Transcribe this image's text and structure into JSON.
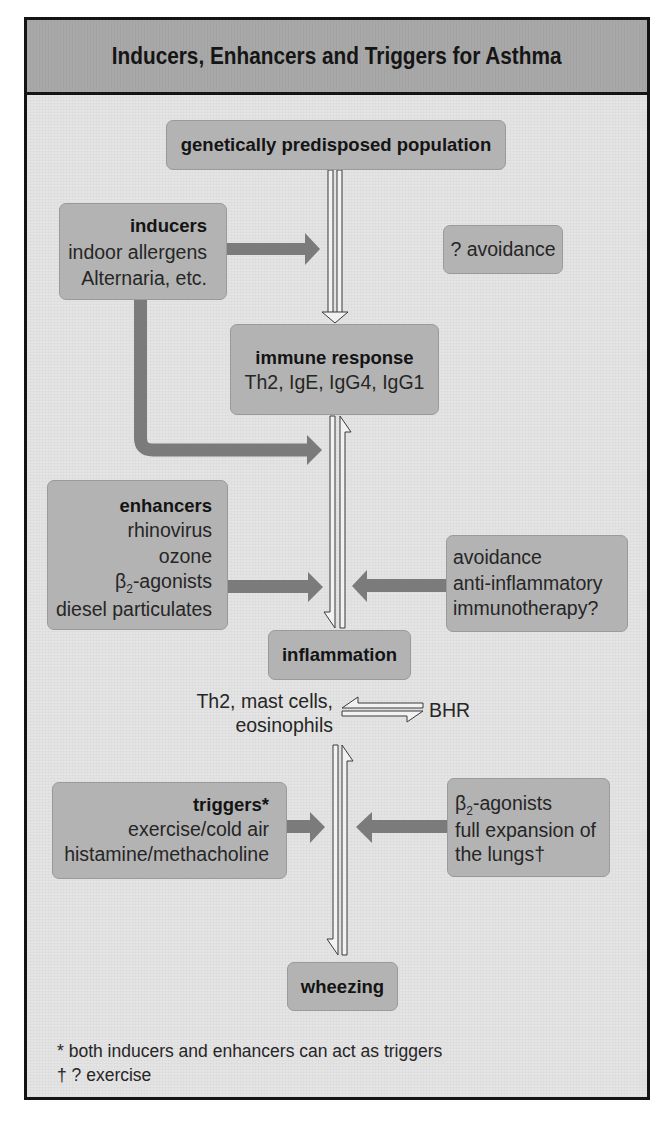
{
  "figure": {
    "title": "Inducers, Enhancers and Triggers for Asthma"
  },
  "colors": {
    "title_band": "#a8a8a8",
    "panel_background": "#e4e4e4",
    "box_fill": "#b3b3b3",
    "box_border": "#9a9a9a",
    "solid_arrow": "#7b7b7b",
    "outline_arrow_stroke": "#3a3a3a",
    "outline_arrow_fill": "#f2f2f2",
    "frame_border": "#141414",
    "text": "#1c1c1c"
  },
  "nodes": {
    "population": {
      "label": "genetically predisposed population"
    },
    "inducers": {
      "heading": "inducers",
      "items": [
        "indoor allergens",
        "Alternaria, etc."
      ]
    },
    "inducer_intervention": {
      "label": "? avoidance"
    },
    "immune_response": {
      "heading": "immune response",
      "detail": "Th2, IgE, IgG4, IgG1"
    },
    "enhancers": {
      "heading": "enhancers",
      "items": [
        "rhinovirus",
        "ozone",
        {
          "symbol": "β",
          "subscript": "2",
          "suffix": "-agonists"
        },
        "diesel particulates"
      ]
    },
    "enhancer_interventions": {
      "items": [
        "avoidance",
        "anti-inflammatory",
        "immunotherapy?"
      ]
    },
    "inflammation": {
      "label": "inflammation"
    },
    "inflammation_components": {
      "cells": [
        "Th2, mast cells,",
        "eosinophils"
      ],
      "linked_to": "BHR"
    },
    "triggers": {
      "heading": "triggers*",
      "items": [
        "exercise/cold air",
        "histamine/methacholine"
      ]
    },
    "trigger_interventions": {
      "items": [
        {
          "symbol": "β",
          "subscript": "2",
          "suffix": "-agonists"
        },
        "full expansion of",
        "the lungs†"
      ]
    },
    "wheezing": {
      "label": "wheezing"
    }
  },
  "edges": [
    {
      "from": "population",
      "to": "immune_response",
      "style": "hollow double arrow (down)"
    },
    {
      "from": "inducers",
      "to": "population-immune pathway",
      "style": "solid arrow"
    },
    {
      "from": "inducers",
      "to": "immune-inflammation pathway",
      "style": "solid L-shaped arrow"
    },
    {
      "from": "immune_response",
      "to": "inflammation",
      "style": "bidirectional harpoons"
    },
    {
      "from": "enhancers",
      "to": "immune-inflammation pathway",
      "style": "solid arrow"
    },
    {
      "from": "enhancer_interventions",
      "to": "immune-inflammation pathway",
      "style": "solid arrow (blocking)"
    },
    {
      "from": "inflammation_components",
      "to": "BHR",
      "style": "equilibrium harpoons"
    },
    {
      "from": "inflammation",
      "to": "wheezing",
      "style": "bidirectional harpoons"
    },
    {
      "from": "triggers",
      "to": "inflammation-wheezing pathway",
      "style": "solid arrow"
    },
    {
      "from": "trigger_interventions",
      "to": "inflammation-wheezing pathway",
      "style": "solid arrow (blocking)"
    }
  ],
  "footnotes": [
    "* both inducers and enhancers can act as triggers",
    "† ? exercise"
  ]
}
